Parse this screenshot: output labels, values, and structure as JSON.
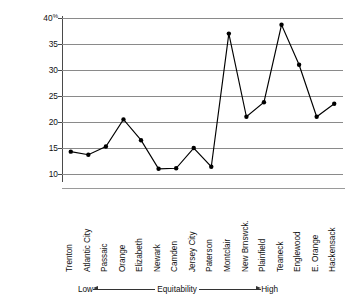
{
  "chart_data": {
    "type": "line",
    "title": "",
    "xlabel": "Equitability",
    "ylabel": "Per cent Business and Professional Class",
    "ylim": [
      9,
      40
    ],
    "yticks": [
      10,
      15,
      20,
      25,
      30,
      35,
      40
    ],
    "ytick_labels": [
      "10",
      "15",
      "20",
      "25",
      "30",
      "35",
      "40"
    ],
    "y_unit_suffix": "%",
    "grid": true,
    "legend": false,
    "marker": "filled-circle",
    "categories": [
      "Trenton",
      "Atlantic City",
      "Passaic",
      "Orange",
      "Elizabeth",
      "Newark",
      "Camden",
      "Jersey City",
      "Paterson",
      "Montclair",
      "New Brnswck.",
      "Plainfield",
      "Teaneck",
      "Englewood",
      "E. Orange",
      "Hackensack"
    ],
    "values": [
      14.3,
      13.7,
      15.3,
      20.5,
      16.5,
      11.0,
      11.1,
      15.0,
      11.4,
      37.0,
      21.0,
      23.8,
      38.7,
      31.0,
      21.0,
      23.5
    ],
    "axis_annotation": {
      "low": "Low",
      "center": "Equitability",
      "high": "High"
    }
  },
  "colors": {
    "line": "#000000",
    "grid": "#8a8a8a",
    "text": "#111111",
    "background": "#ffffff"
  }
}
